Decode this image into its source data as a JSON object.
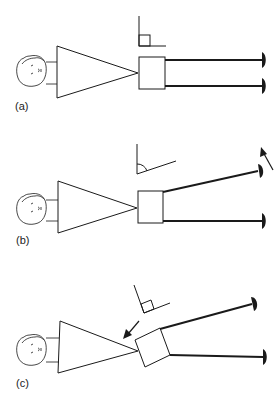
{
  "figure": {
    "top_fragment_text": "",
    "colors": {
      "ink": "#1a1a1a",
      "background": "#ffffff"
    },
    "panels": [
      {
        "id": "a",
        "label": "(a)",
        "description": "Face, triangle (amplifier) feeding square box with two horizontal wires to electrodes; right-angle symbol above box"
      },
      {
        "id": "b",
        "label": "(b)",
        "description": "Top wire tilted upward; obtuse angle symbol above box; arrow pointing up-left near top electrode"
      },
      {
        "id": "c",
        "label": "(c)",
        "description": "Box rotated; rotated right-angle symbol; arrow pointing down-left toward triangle apex"
      }
    ]
  }
}
